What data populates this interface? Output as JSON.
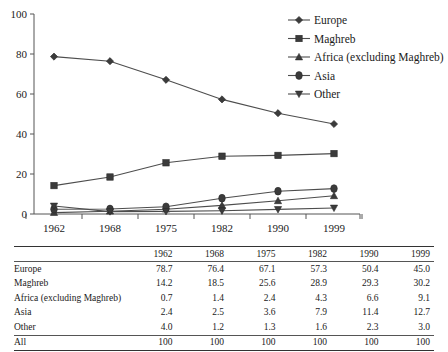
{
  "chart_data": {
    "type": "line",
    "title": "",
    "xlabel": "",
    "ylabel": "",
    "categories": [
      "1962",
      "1968",
      "1975",
      "1982",
      "1990",
      "1999"
    ],
    "ylim": [
      0,
      100
    ],
    "yticks": [
      0,
      20,
      40,
      60,
      80,
      100
    ],
    "grid": false,
    "legend_position": "top-right",
    "series": [
      {
        "name": "Europe",
        "marker": "diamond",
        "values": [
          78.7,
          76.4,
          67.1,
          57.3,
          50.4,
          45.0
        ]
      },
      {
        "name": "Maghreb",
        "marker": "square",
        "values": [
          14.2,
          18.5,
          25.6,
          28.9,
          29.3,
          30.2
        ]
      },
      {
        "name": "Africa (excluding Maghreb)",
        "marker": "triangle-up",
        "values": [
          0.7,
          1.4,
          2.4,
          4.3,
          6.6,
          9.1
        ]
      },
      {
        "name": "Asia",
        "marker": "circle",
        "values": [
          2.4,
          2.5,
          3.6,
          7.9,
          11.4,
          12.7
        ]
      },
      {
        "name": "Other",
        "marker": "triangle-down",
        "values": [
          4.0,
          1.2,
          1.3,
          1.6,
          2.3,
          3.0
        ]
      }
    ],
    "colors": {
      "series_line": "#4d4d4d",
      "marker_fill": "#3b3b3b",
      "axis": "#555555",
      "text": "#1a1a1a"
    }
  },
  "legend": {
    "items": [
      {
        "label": "Europe"
      },
      {
        "label": "Maghreb"
      },
      {
        "label": "Africa (excluding Maghreb)"
      },
      {
        "label": "Asia"
      },
      {
        "label": "Other"
      }
    ]
  },
  "axis": {
    "y_tick_labels": [
      "100",
      "80",
      "60",
      "40",
      "20",
      "0"
    ],
    "x_tick_labels": [
      "1962",
      "1968",
      "1975",
      "1982",
      "1990",
      "1999"
    ]
  },
  "table": {
    "corner_label": "",
    "columns": [
      "1962",
      "1968",
      "1975",
      "1982",
      "1990",
      "1999"
    ],
    "rows": [
      {
        "label": "Europe",
        "values": [
          "78.7",
          "76.4",
          "67.1",
          "57.3",
          "50.4",
          "45.0"
        ]
      },
      {
        "label": "Maghreb",
        "values": [
          "14.2",
          "18.5",
          "25.6",
          "28.9",
          "29.3",
          "30.2"
        ]
      },
      {
        "label": "Africa (excluding Maghreb)",
        "values": [
          "0.7",
          "1.4",
          "2.4",
          "4.3",
          "6.6",
          "9.1"
        ]
      },
      {
        "label": "Asia",
        "values": [
          "2.4",
          "2.5",
          "3.6",
          "7.9",
          "11.4",
          "12.7"
        ]
      },
      {
        "label": "Other",
        "values": [
          "4.0",
          "1.2",
          "1.3",
          "1.6",
          "2.3",
          "3.0"
        ]
      }
    ],
    "total_row": {
      "label": "All",
      "values": [
        "100",
        "100",
        "100",
        "100",
        "100",
        "100"
      ]
    }
  }
}
